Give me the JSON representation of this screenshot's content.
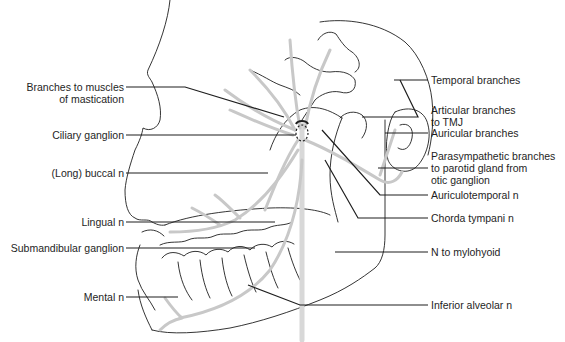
{
  "diagram": {
    "type": "anatomical-illustration",
    "colors": {
      "outline": "#1e1e1e",
      "nerve": "#c8c8c8",
      "leader": "#1e1e1e",
      "background": "#ffffff"
    },
    "labels_left": [
      {
        "id": "branches-mastication",
        "lines": [
          "Branches to muscles",
          "of mastication"
        ]
      },
      {
        "id": "ciliary-ganglion",
        "lines": [
          "Ciliary ganglion"
        ]
      },
      {
        "id": "long-buccal",
        "lines": [
          "(Long) buccal n"
        ]
      },
      {
        "id": "lingual",
        "lines": [
          "Lingual n"
        ]
      },
      {
        "id": "submandibular-ganglion",
        "lines": [
          "Submandibular ganglion"
        ]
      },
      {
        "id": "mental",
        "lines": [
          "Mental n"
        ]
      }
    ],
    "labels_right": [
      {
        "id": "temporal",
        "lines": [
          "Temporal branches"
        ]
      },
      {
        "id": "articular",
        "lines": [
          "Articular branches",
          "to TMJ"
        ]
      },
      {
        "id": "auricular",
        "lines": [
          "Auricular branches"
        ]
      },
      {
        "id": "parasympathetic",
        "lines": [
          "Parasympathetic branches",
          "to parotid gland from",
          "otic ganglion"
        ]
      },
      {
        "id": "auriculotemporal",
        "lines": [
          "Auriculotemporal n"
        ]
      },
      {
        "id": "chorda-tympani",
        "lines": [
          "Chorda tympani n"
        ]
      },
      {
        "id": "mylohyoid",
        "lines": [
          "N to mylohyoid"
        ]
      },
      {
        "id": "inferior-alveolar",
        "lines": [
          "Inferior alveolar n"
        ]
      }
    ]
  }
}
